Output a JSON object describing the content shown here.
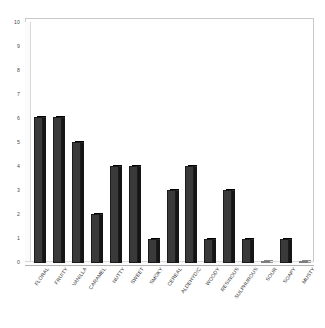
{
  "chart_data": {
    "type": "bar",
    "title": "",
    "subtitle": "",
    "xlabel": "",
    "ylabel": "",
    "ylim": [
      0,
      10
    ],
    "ytick_step": 1,
    "yticks": [
      0,
      1,
      2,
      3,
      4,
      5,
      6,
      7,
      8,
      9,
      10
    ],
    "grid": false,
    "legend": false,
    "legend_position": "none",
    "categories": [
      "FLORAL",
      "FRUITY",
      "VANILLA",
      "CARAMEL",
      "NUTTY",
      "SWEET",
      "SMOKY",
      "CEREAL",
      "ALDEHYDIC",
      "WOODY",
      "RESINOUS",
      "SULPHUROUS",
      "SOUR",
      "SOAPY",
      "MUSTY"
    ],
    "values": [
      6,
      6,
      5,
      2,
      4,
      4,
      1,
      3,
      4,
      1,
      3,
      1,
      0,
      1,
      0
    ],
    "series": [
      {
        "name": "Aroma count",
        "values": [
          6,
          6,
          5,
          2,
          4,
          4,
          1,
          3,
          4,
          1,
          3,
          1,
          0,
          1,
          0
        ]
      }
    ],
    "colors": {
      "bar_face": "#3a3a3a",
      "bar_edge": "#1b1b1b",
      "bar_side": "#151515",
      "frame": "#c9c9c9",
      "axis_text": "#4a4a4a",
      "background": "#ffffff"
    },
    "style": "3d-column"
  }
}
